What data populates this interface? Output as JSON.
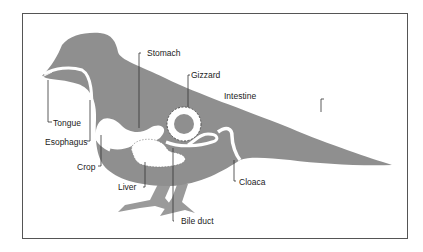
{
  "diagram": {
    "colors": {
      "body": "#8f8f8f",
      "organ": "#ffffff",
      "line": "#333333",
      "frame": "#555555"
    },
    "labels": {
      "tongue": "Tongue",
      "esophagus": "Esophagus",
      "crop": "Crop",
      "stomach": "Stomach",
      "gizzard": "Gizzard",
      "intestine": "Intestine",
      "liver": "Liver",
      "bile_duct": "Bile duct",
      "cloaca": "Cloaca"
    }
  }
}
